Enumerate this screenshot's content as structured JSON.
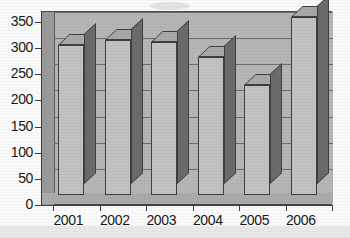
{
  "chart_data": {
    "type": "bar",
    "title": "",
    "subtitle": "",
    "xlabel": "",
    "ylabel": "",
    "categories": [
      "2001",
      "2002",
      "2003",
      "2004",
      "2005",
      "2006"
    ],
    "values": [
      287,
      297,
      293,
      263,
      210,
      340
    ],
    "series": [
      {
        "name": "",
        "values": [
          287,
          297,
          293,
          263,
          210,
          340
        ]
      }
    ],
    "ylim": [
      0,
      350
    ],
    "ytick_step": 50,
    "yticks": [
      0,
      50,
      100,
      150,
      200,
      250,
      300,
      350
    ],
    "ytick_labels": [
      "0",
      "50",
      "100",
      "150",
      "200",
      "250",
      "300",
      "350"
    ],
    "xtick_labels": [
      "2001",
      "2002",
      "2003",
      "2004",
      "2005",
      "2006"
    ],
    "grid": true,
    "grid_axis": "y",
    "legend": false,
    "legend_position": "none",
    "style": "3d-column",
    "annotations": []
  },
  "colors": {
    "plot_background": "#b8b8b8",
    "back_wall": "#b6b6b6",
    "left_wall": "#9a9a9a",
    "floor": "#ababab",
    "bar_front": "#c2c2c2",
    "bar_side": "#6b6b6b",
    "bar_top": "#a9a9a9",
    "gridline": "#6e6e6e",
    "axis": "#3c3c3c",
    "tick_text": "#181818",
    "page_background": "#fbfbfb"
  },
  "axes": {
    "y_axis_name": "value-axis",
    "x_axis_name": "category-axis"
  }
}
